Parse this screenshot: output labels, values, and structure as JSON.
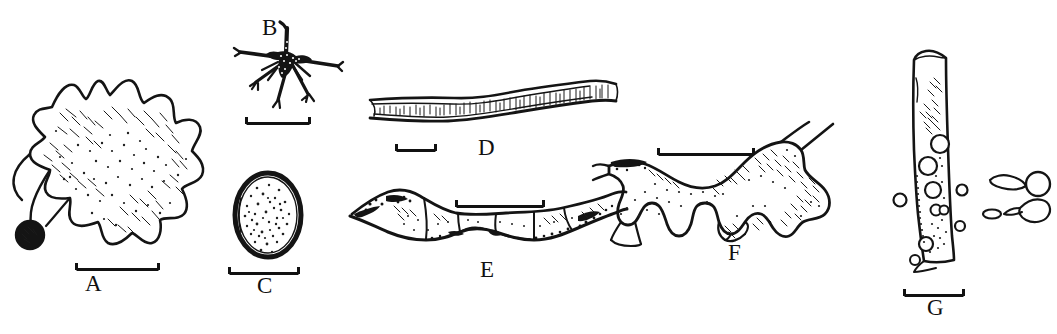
{
  "plate": {
    "kind": "scientific-illustration-plate",
    "medium": "ink line drawing",
    "background_color": "#ffffff",
    "ink_color": "#141414",
    "width": 1057,
    "height": 334,
    "panel_count": 7
  },
  "panels": [
    {
      "id": "A",
      "label": "A",
      "label_x": 85,
      "label_y": 272,
      "description": "large irregular lobed sheet-like body with jagged margin, stippled and hatched interior, dark round knob at lower-left",
      "scalebar": {
        "x": 75,
        "y": 262,
        "length": 85
      }
    },
    {
      "id": "B",
      "label": "B",
      "label_x": 262,
      "label_y": 20,
      "description": "dark branching star-shaped structure with radiating arms",
      "scalebar": {
        "x": 245,
        "y": 121,
        "length": 66
      }
    },
    {
      "id": "C",
      "label": "C",
      "label_x": 257,
      "label_y": 280,
      "description": "ovoid egg-like body with thick dark outline and densely stippled interior",
      "scalebar": {
        "x": 228,
        "y": 271,
        "length": 72
      }
    },
    {
      "id": "D",
      "label": "D",
      "label_x": 478,
      "label_y": 141,
      "description": "elongated horizontal ribbon-like band with fine vertical hatch marks along its length",
      "scalebar": {
        "x": 395,
        "y": 148,
        "length": 42
      }
    },
    {
      "id": "E",
      "label": "E",
      "label_x": 480,
      "label_y": 265,
      "description": "elongated segmented sausage-like body with constrictions and dark granular margins",
      "scalebar": {
        "x": 455,
        "y": 204,
        "length": 90
      }
    },
    {
      "id": "F",
      "label": "F",
      "label_x": 728,
      "label_y": 248,
      "description": "irregular branching lobed mass with arms and hooked processes, hatched interior",
      "scalebar": {
        "x": 657,
        "y": 152,
        "length": 98
      }
    },
    {
      "id": "G",
      "label": "G",
      "label_x": 927,
      "label_y": 302,
      "description": "vertical elongate strip bearing several round cysts, with detached tailed body and small spherical objects alongside",
      "scalebar": {
        "x": 903,
        "y": 293,
        "length": 62
      }
    }
  ]
}
